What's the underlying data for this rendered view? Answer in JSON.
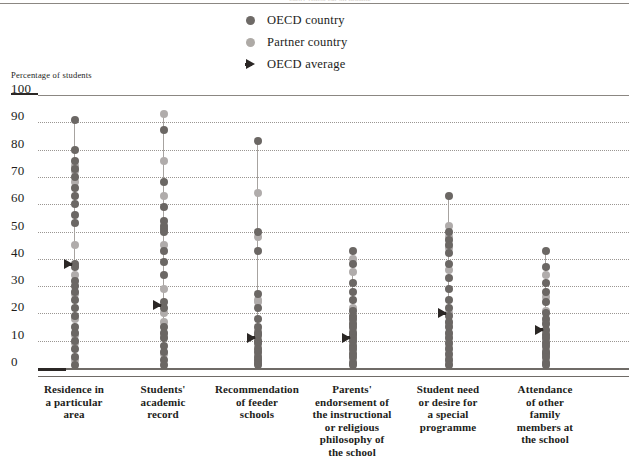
{
  "header": {
    "cut_text": "partly visible cut-off heading"
  },
  "legend": {
    "items": [
      {
        "label": "OECD country",
        "marker": "filled-circle-dark",
        "color": "#6e6a67"
      },
      {
        "label": "Partner country",
        "marker": "filled-circle-light",
        "color": "#aeaaa6"
      },
      {
        "label": "OECD average",
        "marker": "right-arrow",
        "color": "#2b2725"
      }
    ]
  },
  "axis_caption": "Percentage of students",
  "chart_data": {
    "type": "scatter",
    "title": "",
    "xlabel": "",
    "ylabel": "Percentage of students",
    "ylim": [
      0,
      100
    ],
    "yticks": [
      0,
      10,
      20,
      30,
      40,
      50,
      60,
      70,
      80,
      90,
      100
    ],
    "grid": true,
    "legend_position": "top-center",
    "categories": [
      "Residence in a particular area",
      "Students' academic record",
      "Recommendation of feeder schools",
      "Parents' endorsement of the instructional or religious philosophy of the school",
      "Student need or desire for a special programme",
      "Attendance of other family members at the school"
    ],
    "category_label_lines": [
      [
        "Residence in",
        "a particular",
        "area"
      ],
      [
        "Students'",
        "academic",
        "record"
      ],
      [
        "Recommendation",
        "of feeder",
        "schools"
      ],
      [
        "Parents'",
        "endorsement of",
        "the instructional",
        "or religious",
        "philosophy of",
        "the school"
      ],
      [
        "Student need",
        "or desire for",
        "a special",
        "programme"
      ],
      [
        "Attendance",
        "of other",
        "family",
        "members at",
        "the school"
      ]
    ],
    "oecd_average": [
      38,
      23,
      11,
      11,
      20,
      14
    ],
    "series": [
      {
        "name": "Residence in a particular area",
        "oecd_values": [
          91,
          80,
          76,
          73,
          70,
          66,
          63,
          60,
          56,
          53,
          38,
          37,
          32,
          30,
          28,
          25,
          22,
          19,
          15,
          13,
          10,
          7,
          4,
          1
        ],
        "partner_values": [
          74,
          72,
          68,
          45,
          34,
          27,
          18,
          12,
          9,
          3
        ]
      },
      {
        "name": "Students' academic record",
        "oecd_values": [
          87,
          68,
          59,
          54,
          52,
          51,
          50,
          43,
          39,
          34,
          24,
          22,
          15,
          13,
          11,
          8,
          6,
          3,
          1
        ],
        "partner_values": [
          93,
          76,
          63,
          45,
          29,
          20,
          17,
          12,
          5
        ]
      },
      {
        "name": "Recommendation of feeder schools",
        "oecd_values": [
          83,
          50,
          43,
          27,
          22,
          18,
          15,
          13,
          12,
          10,
          9,
          7,
          6,
          4,
          3,
          2,
          1
        ],
        "partner_values": [
          64,
          48,
          25,
          24,
          14,
          11,
          8,
          5,
          3
        ]
      },
      {
        "name": "Parents' endorsement of the instructional or religious philosophy of the school",
        "oecd_values": [
          43,
          38,
          31,
          28,
          25,
          21,
          19,
          18,
          16,
          15,
          13,
          12,
          11,
          10,
          8,
          7,
          5,
          4,
          2,
          1
        ],
        "partner_values": [
          40,
          35,
          22,
          17,
          14,
          9,
          6,
          3
        ]
      },
      {
        "name": "Student need or desire for a special programme",
        "oecd_values": [
          63,
          50,
          47,
          45,
          42,
          38,
          33,
          29,
          25,
          22,
          19,
          17,
          15,
          13,
          11,
          9,
          7,
          5,
          3,
          1
        ],
        "partner_values": [
          52,
          48,
          44,
          36,
          20,
          16,
          12,
          8,
          4,
          2
        ]
      },
      {
        "name": "Attendance of other family members at the school",
        "oecd_values": [
          43,
          37,
          31,
          28,
          24,
          20,
          18,
          16,
          14,
          12,
          11,
          9,
          8,
          6,
          5,
          4,
          2,
          1
        ],
        "partner_values": [
          34,
          26,
          21,
          17,
          13,
          10,
          7,
          3
        ]
      }
    ]
  }
}
